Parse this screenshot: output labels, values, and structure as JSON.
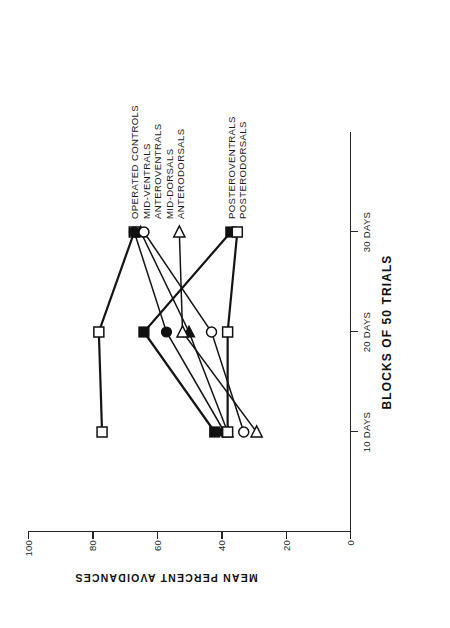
{
  "chart_data": {
    "type": "line",
    "title": "",
    "xlabel": "BLOCKS OF 50 TRIALS",
    "ylabel": "MEAN PERCENT AVOIDANCES",
    "categories": [
      "10 DAYS",
      "20 DAYS",
      "30 DAYS"
    ],
    "x_tick_labels": [
      "10 DAYS",
      "20 DAYS",
      "30 DAYS"
    ],
    "y_tick_labels": [
      "0",
      "20",
      "40",
      "60",
      "80",
      "100"
    ],
    "y_ticks": [
      0,
      20,
      40,
      60,
      80,
      100
    ],
    "ylim": [
      0,
      100
    ],
    "xlim": [
      0,
      4
    ],
    "grid": false,
    "legend_position": "right-inline",
    "rotation_degrees": -90,
    "series": [
      {
        "name": "OPERATED CONTROLS",
        "marker": "open-square",
        "values": [
          77,
          78,
          67
        ]
      },
      {
        "name": "MID-VENTRALS",
        "marker": "filled-circle",
        "values": [
          39,
          57,
          67
        ]
      },
      {
        "name": "ANTEROVENTRALS",
        "marker": "filled-triangle",
        "values": [
          38,
          50,
          65
        ]
      },
      {
        "name": "MID-DORSALS",
        "marker": "open-circle",
        "values": [
          33,
          43,
          64
        ]
      },
      {
        "name": "ANTERODORSALS",
        "marker": "open-triangle",
        "values": [
          29,
          52,
          53
        ]
      },
      {
        "name": "POSTEROVENTRALS",
        "marker": "filled-square",
        "values": [
          42,
          64,
          37
        ]
      },
      {
        "name": "POSTERODORSALS",
        "marker": "open-square",
        "values": [
          38,
          38,
          35
        ]
      }
    ],
    "colors": {
      "line": "#141414",
      "marker_fill_open": "#ffffff",
      "marker_fill_solid": "#111111",
      "axis": "#262626",
      "background": "#ffffff"
    }
  },
  "labels": {
    "x_axis_title": "BLOCKS OF 50 TRIALS",
    "y_axis_title": "MEAN PERCENT AVOIDANCES"
  }
}
